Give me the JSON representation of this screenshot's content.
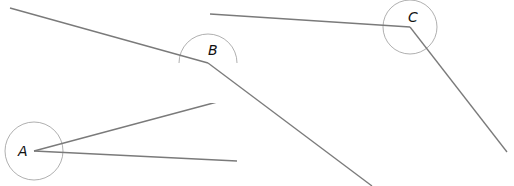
{
  "diagram": {
    "title": "",
    "colors": {
      "line": "#7a7a7a",
      "circle": "#9a9a9a",
      "label": "#111111"
    },
    "angles": [
      {
        "label": "A",
        "vertex": [
          34,
          151
        ],
        "radius": 29,
        "label_pos": [
          18,
          156
        ],
        "rays": [
          [
            232,
            98
          ],
          [
            237,
            161
          ]
        ]
      },
      {
        "label": "B",
        "vertex": [
          208,
          63
        ],
        "radius": 29,
        "label_pos": [
          208,
          55
        ],
        "rays": [
          [
            10,
            8
          ],
          [
            372,
            186
          ]
        ]
      },
      {
        "label": "C",
        "vertex": [
          410,
          27
        ],
        "radius": 27,
        "label_pos": [
          408,
          22
        ],
        "rays": [
          [
            210,
            14
          ],
          [
            507,
            152
          ]
        ]
      }
    ]
  }
}
